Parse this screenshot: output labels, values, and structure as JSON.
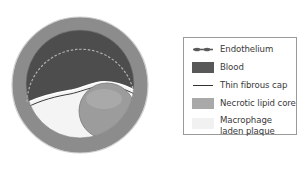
{
  "diagram": {
    "colors": {
      "vessel_wall": "#8c8c8c",
      "vessel_rim": "#d8d8d8",
      "blood": "#4d4d4d",
      "endothelium": "#a8a8a8",
      "fibrous_cap": "#3a3a3a",
      "necrotic_core": "#9c9c9c",
      "necrotic_core_highlight": "#b2b2b2",
      "plaque": "#f4f4f4"
    }
  },
  "legend": {
    "items": [
      {
        "label": "Endothelium",
        "icon": "dashed-line-icon",
        "color": "#6a6a6a"
      },
      {
        "label": "Blood",
        "icon": "swatch",
        "color": "#585858"
      },
      {
        "label": "Thin fibrous cap",
        "icon": "solid-line-icon",
        "color": "#333333"
      },
      {
        "label": "Necrotic lipid core",
        "icon": "swatch",
        "color": "#a9a9a9"
      },
      {
        "label": "Macrophage laden plaque",
        "icon": "swatch",
        "color": "#f1f1f1"
      }
    ]
  }
}
